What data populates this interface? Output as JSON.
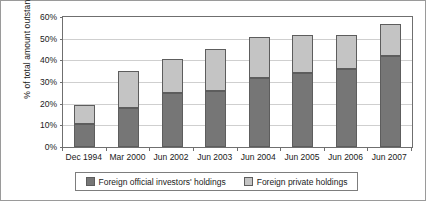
{
  "chart_data": {
    "type": "bar",
    "subtype": "stacked-vertical",
    "title": "",
    "xlabel": "",
    "ylabel": "% of total amount outstanding",
    "ylim": [
      0,
      60
    ],
    "ytick_labels": [
      "0%",
      "10%",
      "20%",
      "30%",
      "40%",
      "50%",
      "60%"
    ],
    "ytick_values": [
      0,
      10,
      20,
      30,
      40,
      50,
      60
    ],
    "grid": true,
    "legend_position": "bottom",
    "categories": [
      "Dec 1994",
      "Mar 2000",
      "Jun 2002",
      "Jun 2003",
      "Jun 2004",
      "Jun 2005",
      "Jun 2006",
      "Jun 2007"
    ],
    "series": [
      {
        "name": "Foreign official investors' holdings",
        "color": "#767676",
        "values": [
          10.6,
          18.2,
          24.7,
          26.0,
          31.9,
          34.3,
          36.2,
          41.8
        ]
      },
      {
        "name": "Foreign private holdings",
        "color": "#c4c4c4",
        "values": [
          8.8,
          17.0,
          16.0,
          19.2,
          18.9,
          17.2,
          15.6,
          15.2
        ]
      }
    ],
    "totals": [
      19.4,
      35.2,
      40.7,
      45.2,
      50.8,
      51.5,
      51.8,
      57.0
    ]
  },
  "legend": {
    "items": [
      {
        "label": "Foreign official investors' holdings",
        "swatch": "#767676"
      },
      {
        "label": "Foreign private holdings",
        "swatch": "#c4c4c4"
      }
    ]
  },
  "colors": {
    "official": "#767676",
    "private": "#c4c4c4",
    "bar_outline": "#5d5d5d",
    "axis": "#6f6f6f",
    "grid": "#cfcfcf",
    "frame": "#9a9a9a",
    "text": "#1a1a1a",
    "background": "#ffffff"
  }
}
